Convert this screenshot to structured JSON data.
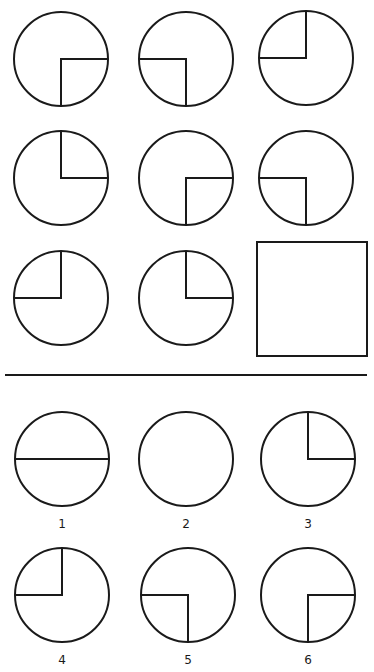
{
  "puzzle": {
    "stroke_color": "#1a1a1a",
    "background": "#ffffff",
    "matrix": [
      {
        "row": 1,
        "col": 1,
        "cx": 61,
        "cy": 59,
        "r": 47,
        "quadrant": "bottom-right"
      },
      {
        "row": 1,
        "col": 2,
        "cx": 186,
        "cy": 59,
        "r": 47,
        "quadrant": "bottom-left"
      },
      {
        "row": 1,
        "col": 3,
        "cx": 306,
        "cy": 58,
        "r": 47,
        "quadrant": "top-left"
      },
      {
        "row": 2,
        "col": 1,
        "cx": 61,
        "cy": 178,
        "r": 47,
        "quadrant": "top-right"
      },
      {
        "row": 2,
        "col": 2,
        "cx": 186,
        "cy": 178,
        "r": 47,
        "quadrant": "bottom-right"
      },
      {
        "row": 2,
        "col": 3,
        "cx": 306,
        "cy": 178,
        "r": 47,
        "quadrant": "bottom-left"
      },
      {
        "row": 3,
        "col": 1,
        "cx": 61,
        "cy": 298,
        "r": 47,
        "quadrant": "top-left"
      },
      {
        "row": 3,
        "col": 2,
        "cx": 186,
        "cy": 298,
        "r": 47,
        "quadrant": "top-right"
      }
    ],
    "missing_cell": {
      "x": 257,
      "y": 242,
      "w": 110,
      "h": 114
    },
    "divider": {
      "x1": 5,
      "x2": 367,
      "y": 375
    }
  },
  "options": [
    {
      "label": "1",
      "cx": 62,
      "cy": 459,
      "r": 47,
      "quadrant": "horizontal-diameter",
      "label_y": 525
    },
    {
      "label": "2",
      "cx": 186,
      "cy": 459,
      "r": 47,
      "quadrant": "none",
      "label_y": 525
    },
    {
      "label": "3",
      "cx": 308,
      "cy": 459,
      "r": 47,
      "quadrant": "top-right",
      "label_y": 525
    },
    {
      "label": "4",
      "cx": 62,
      "cy": 595,
      "r": 47,
      "quadrant": "top-left",
      "label_y": 661
    },
    {
      "label": "5",
      "cx": 188,
      "cy": 595,
      "r": 47,
      "quadrant": "bottom-left",
      "label_y": 661
    },
    {
      "label": "6",
      "cx": 308,
      "cy": 595,
      "r": 47,
      "quadrant": "bottom-right",
      "label_y": 661
    }
  ]
}
